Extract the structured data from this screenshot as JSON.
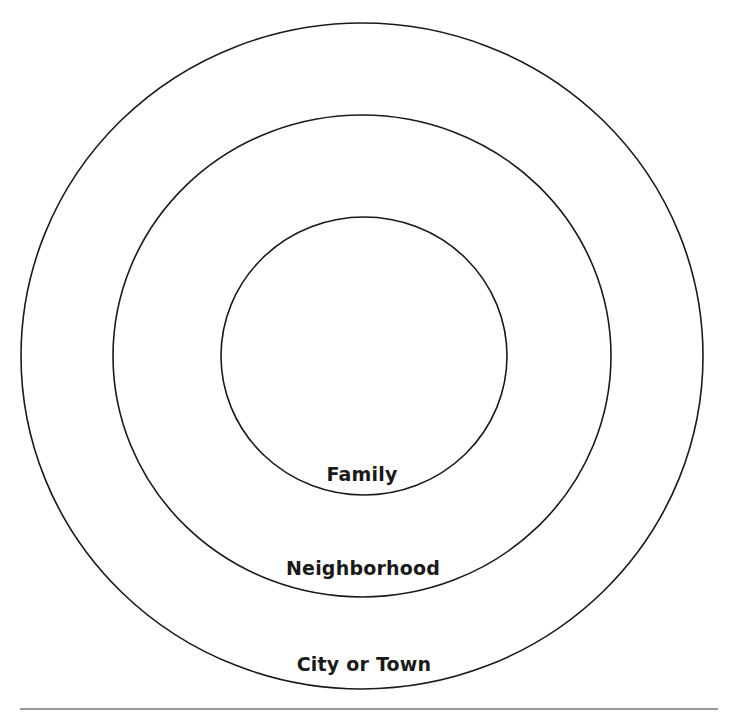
{
  "diagram": {
    "type": "concentric-circles",
    "rings": [
      {
        "id": "inner",
        "label": "Family",
        "cx": 364,
        "cy": 356,
        "rx": 143,
        "ry": 139
      },
      {
        "id": "middle",
        "label": "Neighborhood",
        "cx": 362,
        "cy": 356,
        "rx": 249,
        "ry": 241
      },
      {
        "id": "outer",
        "label": "City or Town",
        "cx": 362,
        "cy": 356,
        "rx": 341,
        "ry": 333
      }
    ],
    "stroke_color": "#1a1a1a",
    "rule_color": "#777777"
  }
}
